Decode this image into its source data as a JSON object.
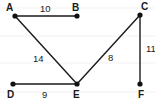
{
  "graph": {
    "nodes": [
      {
        "id": "A",
        "label": "A",
        "x": 15,
        "y": 16,
        "lx": 6,
        "ly": 11
      },
      {
        "id": "B",
        "label": "B",
        "x": 77,
        "y": 16,
        "lx": 72,
        "ly": 11
      },
      {
        "id": "C",
        "label": "C",
        "x": 140,
        "y": 15,
        "lx": 141,
        "ly": 10
      },
      {
        "id": "D",
        "label": "D",
        "x": 13,
        "y": 84,
        "lx": 7,
        "ly": 98
      },
      {
        "id": "E",
        "label": "E",
        "x": 77,
        "y": 84,
        "lx": 73,
        "ly": 98
      },
      {
        "id": "F",
        "label": "F",
        "x": 140,
        "y": 84,
        "lx": 138,
        "ly": 98
      }
    ],
    "edges": [
      {
        "from": "A",
        "to": "B",
        "weight": "10",
        "lx": 40,
        "ly": 12
      },
      {
        "from": "A",
        "to": "E",
        "weight": "14",
        "lx": 33,
        "ly": 62
      },
      {
        "from": "C",
        "to": "E",
        "weight": "8",
        "lx": 108,
        "ly": 61
      },
      {
        "from": "C",
        "to": "F",
        "weight": "11",
        "lx": 146,
        "ly": 52
      },
      {
        "from": "D",
        "to": "E",
        "weight": "9",
        "lx": 42,
        "ly": 98
      }
    ]
  }
}
